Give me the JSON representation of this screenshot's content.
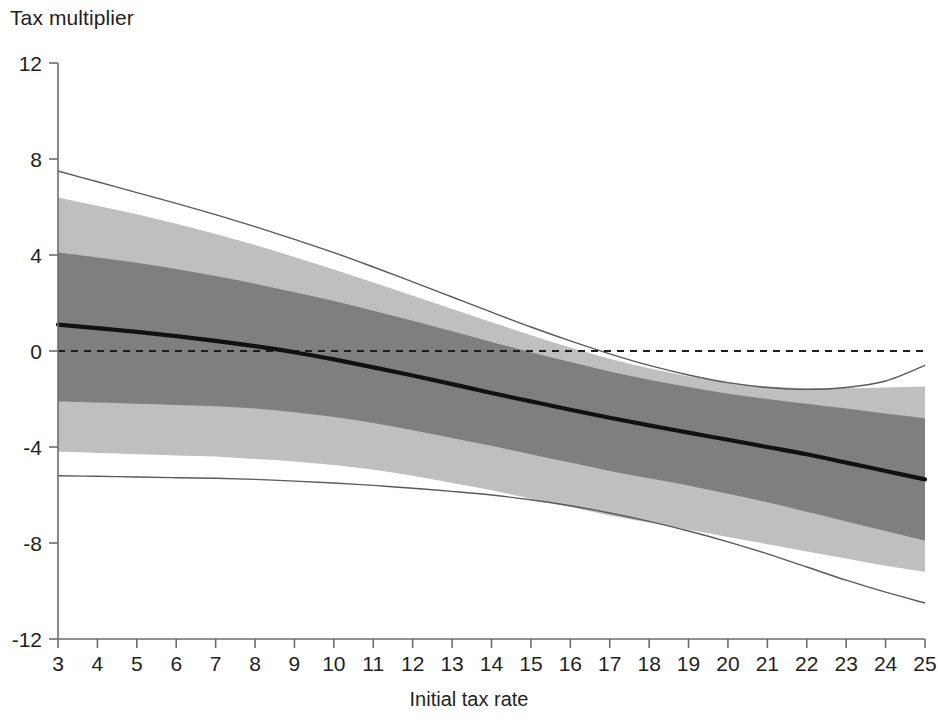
{
  "chart_data": {
    "type": "line",
    "title": "Tax multiplier",
    "subtitle": "",
    "xlabel": "Initial tax rate",
    "ylabel": "Tax multiplier",
    "xlim": [
      3,
      25
    ],
    "ylim": [
      -12,
      12
    ],
    "grid": false,
    "legend_position": "none",
    "x_ticks": [
      3,
      4,
      5,
      6,
      7,
      8,
      9,
      10,
      11,
      12,
      13,
      14,
      15,
      16,
      17,
      18,
      19,
      20,
      21,
      22,
      23,
      24,
      25
    ],
    "x_tick_labels": [
      "3",
      "4",
      "5",
      "6",
      "7",
      "8",
      "9",
      "10",
      "11",
      "12",
      "13",
      "14",
      "15",
      "16",
      "17",
      "18",
      "19",
      "20",
      "21",
      "22",
      "23",
      "24",
      "25"
    ],
    "y_ticks": [
      12,
      8,
      4,
      0,
      -4,
      -8,
      -12
    ],
    "y_tick_labels": [
      "12",
      "8",
      "4",
      "0",
      "-4",
      "-8",
      "-12"
    ],
    "zero_line": 0,
    "zero_line_style": "dashed",
    "x": [
      3,
      4,
      5,
      6,
      7,
      8,
      9,
      10,
      11,
      12,
      13,
      14,
      15,
      16,
      17,
      18,
      19,
      20,
      21,
      22,
      23,
      24,
      25
    ],
    "series": [
      {
        "name": "Point estimate",
        "role": "central-line",
        "color": "#111111",
        "values": [
          1.1,
          0.95,
          0.8,
          0.62,
          0.42,
          0.2,
          -0.05,
          -0.35,
          -0.68,
          -1.02,
          -1.38,
          -1.75,
          -2.1,
          -2.45,
          -2.78,
          -3.1,
          -3.4,
          -3.7,
          -4.0,
          -4.3,
          -4.65,
          -5.0,
          -5.35
        ]
      },
      {
        "name": "68% confidence band (upper)",
        "role": "inner-band-upper",
        "color": "#7f7f7f",
        "values": [
          4.1,
          3.9,
          3.68,
          3.42,
          3.12,
          2.8,
          2.45,
          2.08,
          1.68,
          1.26,
          0.82,
          0.38,
          -0.05,
          -0.46,
          -0.85,
          -1.2,
          -1.5,
          -1.78,
          -2.0,
          -2.2,
          -2.4,
          -2.6,
          -2.8
        ]
      },
      {
        "name": "68% confidence band (lower)",
        "role": "inner-band-lower",
        "color": "#7f7f7f",
        "values": [
          -2.1,
          -2.15,
          -2.2,
          -2.25,
          -2.3,
          -2.4,
          -2.55,
          -2.75,
          -3.0,
          -3.3,
          -3.62,
          -3.95,
          -4.3,
          -4.65,
          -5.0,
          -5.3,
          -5.6,
          -5.95,
          -6.3,
          -6.7,
          -7.1,
          -7.5,
          -7.9
        ]
      },
      {
        "name": "80% confidence band (upper)",
        "role": "outer-band-upper",
        "color": "#bfbfbf",
        "values": [
          6.4,
          6.05,
          5.7,
          5.3,
          4.88,
          4.42,
          3.92,
          3.4,
          2.85,
          2.3,
          1.75,
          1.2,
          0.66,
          0.15,
          -0.32,
          -0.72,
          -1.05,
          -1.3,
          -1.48,
          -1.55,
          -1.55,
          -1.52,
          -1.48
        ]
      },
      {
        "name": "80% confidence band (lower)",
        "role": "outer-band-lower",
        "color": "#bfbfbf",
        "values": [
          -4.2,
          -4.25,
          -4.3,
          -4.35,
          -4.4,
          -4.5,
          -4.6,
          -4.75,
          -4.95,
          -5.2,
          -5.5,
          -5.8,
          -6.15,
          -6.5,
          -6.85,
          -7.15,
          -7.45,
          -7.75,
          -8.05,
          -8.35,
          -8.65,
          -8.95,
          -9.2
        ]
      },
      {
        "name": "90% confidence band (upper)",
        "role": "outer-line-upper",
        "color": "#5a5a5a",
        "values": [
          7.5,
          7.05,
          6.6,
          6.15,
          5.68,
          5.18,
          4.65,
          4.1,
          3.5,
          2.88,
          2.25,
          1.62,
          1.0,
          0.42,
          -0.12,
          -0.6,
          -1.0,
          -1.32,
          -1.52,
          -1.6,
          -1.52,
          -1.25,
          -0.6
        ]
      },
      {
        "name": "90% confidence band (lower)",
        "role": "outer-line-lower",
        "color": "#5a5a5a",
        "values": [
          -5.2,
          -5.22,
          -5.25,
          -5.28,
          -5.3,
          -5.35,
          -5.42,
          -5.5,
          -5.6,
          -5.72,
          -5.85,
          -6.0,
          -6.2,
          -6.45,
          -6.75,
          -7.1,
          -7.5,
          -7.95,
          -8.45,
          -9.0,
          -9.55,
          -10.05,
          -10.5
        ]
      }
    ],
    "colors": {
      "central_line": "#111111",
      "inner_band": "#7f7f7f",
      "outer_band": "#bfbfbf",
      "outer_line": "#5a5a5a",
      "axis": "#6d6d6d",
      "text": "#231f20",
      "background": "#ffffff"
    }
  }
}
